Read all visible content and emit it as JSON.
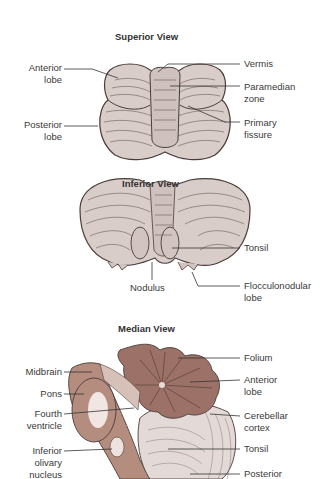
{
  "colors": {
    "cerebellum_fill": "#d9cdca",
    "cerebellum_dark": "#c2b2ae",
    "outline": "#4a3c38",
    "brainstem_fill": "#b58d7f",
    "arbor_fill": "#9c7268",
    "line": "#333333"
  },
  "views": [
    {
      "title": "Superior View",
      "labels_left": [
        {
          "text_1": "Anterior",
          "text_2": "lobe"
        },
        {
          "text_1": "Posterior",
          "text_2": "lobe"
        }
      ],
      "labels_right": [
        {
          "text_1": "Vermis",
          "text_2": ""
        },
        {
          "text_1": "Paramedian",
          "text_2": "zone"
        },
        {
          "text_1": "Primary",
          "text_2": "fissure"
        }
      ]
    },
    {
      "title": "Inferior View",
      "labels_bottom": [
        {
          "text_1": "Nodulus"
        }
      ],
      "labels_right": [
        {
          "text_1": "Tonsil",
          "text_2": ""
        },
        {
          "text_1": "Flocculonodular",
          "text_2": "lobe"
        }
      ]
    },
    {
      "title": "Median View",
      "labels_left": [
        {
          "text_1": "Midbrain",
          "text_2": "",
          "text_3": ""
        },
        {
          "text_1": "Pons",
          "text_2": "",
          "text_3": ""
        },
        {
          "text_1": "Fourth",
          "text_2": "ventricle",
          "text_3": ""
        },
        {
          "text_1": "Inferior",
          "text_2": "olivary",
          "text_3": "nucleus"
        }
      ],
      "labels_right": [
        {
          "text_1": "Folium",
          "text_2": ""
        },
        {
          "text_1": "Anterior",
          "text_2": "lobe"
        },
        {
          "text_1": "Cerebellar",
          "text_2": "cortex"
        },
        {
          "text_1": "Tonsil",
          "text_2": ""
        },
        {
          "text_1": "Posterior",
          "text_2": ""
        }
      ]
    }
  ]
}
